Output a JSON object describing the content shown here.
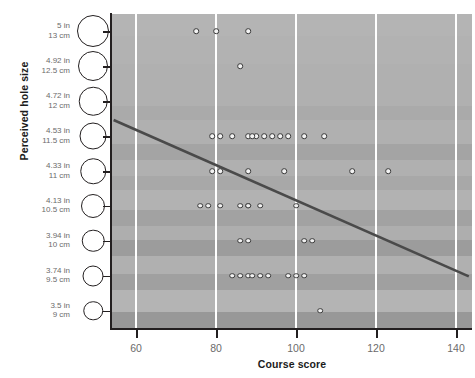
{
  "chart_data": {
    "type": "scatter",
    "title": "",
    "xlabel": "Course score",
    "ylabel": "Perceived hole size",
    "xlim": [
      54,
      144
    ],
    "ylim": [
      8.75,
      13.25
    ],
    "grid": "vertical-white-gridlines",
    "legend": "none",
    "x_ticks": [
      60,
      80,
      100,
      120,
      140
    ],
    "x_tick_labels": [
      "60",
      "80",
      "100",
      "120",
      "140"
    ],
    "y_ticks_cm": [
      13,
      12.5,
      12,
      11.5,
      11,
      10.5,
      10,
      9.5,
      9
    ],
    "y_tick_labels": [
      {
        "inches": "5 in",
        "cm": "13 cm"
      },
      {
        "inches": "4.92 in",
        "cm": "12.5 cm"
      },
      {
        "inches": "4.72 in",
        "cm": "12 cm"
      },
      {
        "inches": "4.53 in",
        "cm": "11.5 cm"
      },
      {
        "inches": "4.33 in",
        "cm": "11 cm"
      },
      {
        "inches": "4.13 in",
        "cm": "10.5 cm"
      },
      {
        "inches": "3.94 in",
        "cm": "10 cm"
      },
      {
        "inches": "3.74 in",
        "cm": "9.5 cm"
      },
      {
        "inches": "3.5 in",
        "cm": "9 cm"
      }
    ],
    "points": [
      {
        "x": 75,
        "y": 13
      },
      {
        "x": 80,
        "y": 13
      },
      {
        "x": 88,
        "y": 13
      },
      {
        "x": 86,
        "y": 12.5
      },
      {
        "x": 79,
        "y": 11.5
      },
      {
        "x": 81,
        "y": 11.5
      },
      {
        "x": 84,
        "y": 11.5
      },
      {
        "x": 88,
        "y": 11.5
      },
      {
        "x": 90,
        "y": 11.5
      },
      {
        "x": 92,
        "y": 11.5
      },
      {
        "x": 94,
        "y": 11.5
      },
      {
        "x": 96,
        "y": 11.5
      },
      {
        "x": 98,
        "y": 11.5
      },
      {
        "x": 102,
        "y": 11.5
      },
      {
        "x": 107,
        "y": 11.5
      },
      {
        "x": 79,
        "y": 11
      },
      {
        "x": 81,
        "y": 11
      },
      {
        "x": 88,
        "y": 11
      },
      {
        "x": 97,
        "y": 11
      },
      {
        "x": 114,
        "y": 11
      },
      {
        "x": 123,
        "y": 11
      },
      {
        "x": 76,
        "y": 10.5
      },
      {
        "x": 78,
        "y": 10.5
      },
      {
        "x": 81,
        "y": 10.5
      },
      {
        "x": 86,
        "y": 10.5
      },
      {
        "x": 88,
        "y": 10.5
      },
      {
        "x": 91,
        "y": 10.5
      },
      {
        "x": 100,
        "y": 10.5
      },
      {
        "x": 86,
        "y": 10
      },
      {
        "x": 88,
        "y": 10
      },
      {
        "x": 102,
        "y": 10
      },
      {
        "x": 104,
        "y": 10
      },
      {
        "x": 84,
        "y": 9.5
      },
      {
        "x": 86,
        "y": 9.5
      },
      {
        "x": 88,
        "y": 9.5
      },
      {
        "x": 89,
        "y": 9.5
      },
      {
        "x": 91,
        "y": 9.5
      },
      {
        "x": 93,
        "y": 9.5
      },
      {
        "x": 98,
        "y": 9.5
      },
      {
        "x": 100,
        "y": 9.5
      },
      {
        "x": 102,
        "y": 9.5
      },
      {
        "x": 106,
        "y": 9
      },
      {
        "x": 88,
        "y": 10.5
      },
      {
        "x": 89,
        "y": 11.5
      }
    ],
    "trendline": {
      "label": "regression-line",
      "x_start": 54.4,
      "y_start": 11.73,
      "x_end": 143.2,
      "y_end": 9.49,
      "color": "#4a4a4a"
    },
    "hole_circle_diameters_px": [
      30,
      28,
      26.5,
      25,
      23.5,
      22,
      20.5,
      19,
      17.5
    ]
  },
  "colors": {
    "plot_background": "#b0b0b0",
    "gridline": "#ffffff",
    "axis": "#231f20",
    "tick_label": "#6b6b6b",
    "axis_title": "#1b1b1b",
    "point_fill": "#f2f2f2",
    "point_stroke": "#3a3a3a",
    "trendline": "#4a4a4a"
  }
}
